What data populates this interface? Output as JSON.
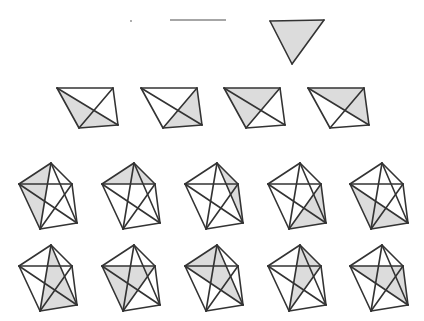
{
  "diagram": {
    "title": "",
    "colors": {
      "background": "#ffffff",
      "edge": "#333333",
      "shade": "#dcdcdc",
      "k2_edge": "#888888",
      "k1_dot": "#888888"
    },
    "k1": {
      "label": "K1",
      "vertex": [
        131,
        21
      ],
      "triangles": 0
    },
    "k2": {
      "label": "K2",
      "vertices": [
        [
          170,
          20
        ],
        [
          226,
          20
        ]
      ],
      "triangles": 0
    },
    "k3": {
      "label": "K3",
      "vertices": [
        [
          270,
          21
        ],
        [
          324,
          20
        ],
        [
          292,
          64
        ]
      ],
      "shaded": [
        [
          0,
          1,
          2
        ]
      ]
    },
    "k4": {
      "label": "K4",
      "base_vertices": [
        [
          0,
          0
        ],
        [
          56,
          0
        ],
        [
          61,
          37
        ],
        [
          22,
          40
        ]
      ],
      "origin_offsets": [
        [
          57,
          88
        ],
        [
          141,
          88
        ],
        [
          224,
          88
        ],
        [
          308,
          88
        ]
      ],
      "shaded": [
        [
          0,
          2,
          3
        ],
        [
          1,
          2,
          3
        ],
        [
          0,
          1,
          3
        ],
        [
          0,
          1,
          2
        ]
      ]
    },
    "k5": {
      "label": "K5",
      "base_vertices": [
        [
          32,
          0
        ],
        [
          0,
          21
        ],
        [
          53,
          21
        ],
        [
          58,
          60
        ],
        [
          21,
          66
        ]
      ],
      "row1_offsets": [
        [
          19,
          163
        ],
        [
          102,
          163
        ],
        [
          185,
          163
        ],
        [
          268,
          163
        ],
        [
          350,
          163
        ]
      ],
      "row2_offsets": [
        [
          19,
          245
        ],
        [
          102,
          245
        ],
        [
          185,
          245
        ],
        [
          268,
          245
        ],
        [
          350,
          245
        ]
      ],
      "row1_shaded": [
        [
          0,
          1,
          2
        ],
        [
          0,
          1,
          2
        ],
        [
          0,
          2,
          3
        ],
        [
          2,
          3,
          4
        ],
        [
          1,
          3,
          4
        ]
      ],
      "row1_shaded_actual": [
        [
          0,
          1,
          4
        ],
        [
          0,
          1,
          2
        ],
        [
          0,
          2,
          3
        ],
        [
          2,
          3,
          4
        ],
        [
          1,
          3,
          4
        ]
      ],
      "row2_shaded": [
        [
          0,
          3,
          4
        ],
        [
          1,
          2,
          4
        ],
        [
          0,
          1,
          3
        ],
        [
          0,
          2,
          4
        ],
        [
          1,
          2,
          3
        ]
      ]
    },
    "triangle_counts": {
      "K1": 0,
      "K2": 0,
      "K3": 1,
      "K4": 4,
      "K5": 10
    }
  }
}
